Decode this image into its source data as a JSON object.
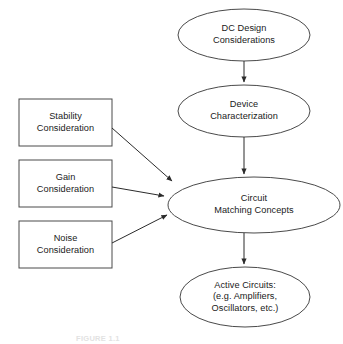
{
  "figure": {
    "caption": "FIGURE 1.1",
    "width": 343,
    "height": 344,
    "background_color": "#ffffff",
    "shape_stroke_color": "#4a4a4a",
    "arrow_color": "#2b2b2b",
    "text_color": "#1a1a1a"
  },
  "nodes": {
    "dc_design": {
      "shape": "ellipse",
      "line1": "DC Design",
      "line2": "Considerations"
    },
    "device_characterization": {
      "shape": "ellipse",
      "line1": "Device",
      "line2": "Characterization"
    },
    "circuit_matching": {
      "shape": "ellipse",
      "line1": "Circuit",
      "line2": "Matching Concepts"
    },
    "active_circuits": {
      "shape": "ellipse",
      "line1": "Active Circuits:",
      "line2": "(e.g. Amplifiers,",
      "line3": "Oscillators, etc.)"
    },
    "stability": {
      "shape": "rectangle",
      "line1": "Stability",
      "line2": "Consideration"
    },
    "gain": {
      "shape": "rectangle",
      "line1": "Gain",
      "line2": "Consideration"
    },
    "noise": {
      "shape": "rectangle",
      "line1": "Noise",
      "line2": "Consideration"
    }
  },
  "edges": [
    {
      "from": "dc_design",
      "to": "device_characterization",
      "style": "vertical-arrow"
    },
    {
      "from": "device_characterization",
      "to": "circuit_matching",
      "style": "vertical-arrow"
    },
    {
      "from": "circuit_matching",
      "to": "active_circuits",
      "style": "vertical-arrow"
    },
    {
      "from": "stability",
      "to": "circuit_matching",
      "style": "diagonal-arrow"
    },
    {
      "from": "gain",
      "to": "circuit_matching",
      "style": "horizontal-arrow"
    },
    {
      "from": "noise",
      "to": "circuit_matching",
      "style": "diagonal-arrow"
    }
  ]
}
